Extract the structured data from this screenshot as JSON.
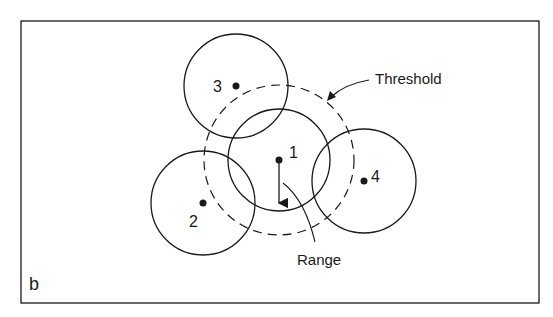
{
  "figure": {
    "panel_label": "b",
    "frame": {
      "x": 21,
      "y": 21,
      "width": 518,
      "height": 282
    },
    "stroke_color": "#1a1a1a",
    "background": "#ffffff"
  },
  "nodes": [
    {
      "id": "1",
      "label": "1",
      "cx": 279,
      "cy": 160,
      "r": 51,
      "label_x": 289,
      "label_y": 158
    },
    {
      "id": "2",
      "label": "2",
      "cx": 203,
      "cy": 203,
      "r": 52,
      "label_x": 189,
      "label_y": 227
    },
    {
      "id": "3",
      "label": "3",
      "cx": 236,
      "cy": 86,
      "r": 52,
      "label_x": 213,
      "label_y": 92
    },
    {
      "id": "4",
      "label": "4",
      "cx": 364,
      "cy": 181,
      "r": 52,
      "label_x": 371,
      "label_y": 182
    }
  ],
  "threshold": {
    "label": "Threshold",
    "cx": 279,
    "cy": 160,
    "r": 75,
    "label_x": 375,
    "label_y": 84
  },
  "range": {
    "label": "Range",
    "label_x": 297,
    "label_y": 265
  },
  "annotations": {
    "threshold_arrow": "Threshold",
    "range_pointer": "Range"
  }
}
